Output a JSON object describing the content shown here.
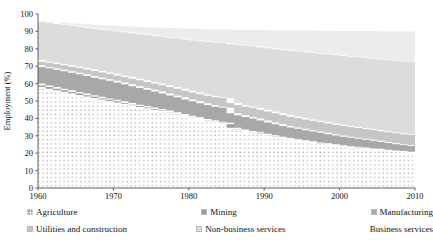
{
  "chart_data": {
    "type": "area",
    "title": "",
    "subtitle": "",
    "xlabel": "",
    "ylabel": "Employment (%)",
    "xlim": [
      1960,
      2010
    ],
    "ylim": [
      0,
      100
    ],
    "grid": false,
    "stacked": true,
    "legend_position": "bottom",
    "xticks": [
      1960,
      1970,
      1980,
      1990,
      2000,
      2010
    ],
    "yticks": [
      0,
      10,
      20,
      30,
      40,
      50,
      60,
      70,
      80,
      90,
      100
    ],
    "x": [
      1960,
      1961,
      1962,
      1963,
      1964,
      1965,
      1966,
      1967,
      1968,
      1969,
      1970,
      1971,
      1972,
      1973,
      1974,
      1975,
      1976,
      1977,
      1978,
      1979,
      1980,
      1981,
      1982,
      1983,
      1984,
      1985,
      1986,
      1987,
      1988,
      1989,
      1990,
      1991,
      1992,
      1993,
      1994,
      1995,
      1996,
      1997,
      1998,
      1999,
      2000,
      2001,
      2002,
      2003,
      2004,
      2005,
      2006,
      2007,
      2008,
      2009,
      2010
    ],
    "series": [
      {
        "name": "Agriculture",
        "color": "#ffffff",
        "pattern": "dots",
        "values": [
          58.0,
          57.0,
          56.2,
          55.3,
          54.4,
          53.5,
          52.6,
          51.7,
          50.8,
          50.0,
          49.2,
          48.4,
          47.5,
          46.6,
          45.8,
          45.0,
          44.2,
          43.4,
          42.4,
          41.5,
          40.5,
          39.6,
          38.8,
          38.0,
          37.2,
          36.6,
          33.8,
          32.8,
          32.0,
          31.4,
          30.5,
          29.6,
          28.8,
          28.0,
          27.4,
          26.8,
          26.2,
          25.6,
          25.1,
          24.6,
          24.1,
          23.6,
          23.2,
          22.8,
          22.4,
          22.0,
          21.6,
          21.2,
          20.8,
          20.4,
          20.0
        ]
      },
      {
        "name": "Mining",
        "color": "#9b9b9b",
        "values": [
          2.0,
          1.9,
          1.9,
          1.8,
          1.8,
          1.7,
          1.7,
          1.6,
          1.6,
          1.5,
          1.5,
          1.4,
          1.4,
          1.3,
          1.3,
          1.2,
          1.2,
          1.1,
          1.1,
          1.0,
          1.0,
          1.0,
          0.9,
          0.9,
          0.9,
          0.9,
          0.8,
          0.8,
          0.8,
          0.8,
          0.7,
          0.7,
          0.7,
          0.7,
          0.6,
          0.6,
          0.6,
          0.6,
          0.6,
          0.5,
          0.5,
          0.5,
          0.5,
          0.5,
          0.5,
          0.5,
          0.4,
          0.4,
          0.4,
          0.4,
          0.4
        ]
      },
      {
        "name": "Manufacturing",
        "color": "#a8a8a8",
        "values": [
          10.5,
          10.6,
          10.7,
          10.8,
          10.9,
          11.0,
          11.1,
          11.1,
          11.0,
          11.0,
          10.9,
          10.8,
          10.7,
          10.6,
          10.4,
          10.2,
          10.0,
          9.8,
          9.7,
          9.6,
          9.4,
          9.2,
          9.0,
          8.8,
          8.6,
          8.6,
          8.4,
          8.2,
          8.0,
          7.8,
          7.6,
          7.4,
          7.2,
          7.0,
          6.8,
          6.6,
          6.4,
          6.2,
          6.0,
          5.8,
          5.6,
          5.4,
          5.2,
          5.0,
          4.8,
          4.6,
          4.4,
          4.2,
          4.0,
          3.9,
          3.8
        ]
      },
      {
        "name": "Utilities and construction",
        "color": "#c6c6c6",
        "values": [
          3.0,
          3.1,
          3.2,
          3.3,
          3.4,
          3.5,
          3.6,
          3.7,
          3.8,
          3.9,
          4.0,
          4.1,
          4.2,
          4.3,
          4.4,
          4.5,
          4.6,
          4.7,
          4.8,
          4.9,
          5.0,
          5.1,
          5.2,
          5.3,
          5.4,
          5.6,
          5.8,
          5.9,
          6.0,
          6.1,
          6.2,
          6.2,
          6.2,
          6.2,
          6.2,
          6.2,
          6.2,
          6.2,
          6.2,
          6.2,
          6.2,
          6.2,
          6.2,
          6.2,
          6.2,
          6.2,
          6.2,
          6.2,
          6.2,
          6.2,
          6.2
        ]
      },
      {
        "name": "Non-business services",
        "color": "#dcdcdc",
        "values": [
          22.5,
          22.7,
          22.9,
          23.1,
          23.3,
          23.5,
          23.7,
          24.0,
          24.3,
          24.6,
          24.9,
          25.3,
          25.7,
          26.1,
          26.5,
          27.0,
          27.4,
          27.9,
          28.4,
          28.9,
          29.4,
          29.9,
          30.4,
          30.9,
          31.4,
          31.6,
          33.8,
          34.5,
          35.0,
          35.3,
          35.8,
          36.4,
          36.9,
          37.4,
          37.8,
          38.2,
          38.6,
          39.0,
          39.3,
          39.6,
          39.9,
          40.2,
          40.4,
          40.6,
          40.8,
          41.0,
          41.2,
          41.4,
          41.6,
          41.8,
          42.0
        ]
      },
      {
        "name": "Business services",
        "color": "#ececec",
        "values": [
          17.6,
          17.6,
          17.6,
          17.5,
          17.5,
          17.5,
          17.4,
          17.4,
          17.4,
          17.4,
          17.3,
          17.3,
          17.3,
          17.3,
          17.3,
          17.3,
          17.3,
          17.3,
          17.3,
          17.3,
          17.3,
          17.3,
          17.3,
          17.3,
          17.3,
          17.3,
          17.3,
          17.3,
          17.3,
          17.3,
          17.3,
          17.3,
          17.3,
          17.3,
          17.3,
          17.3,
          17.3,
          17.3,
          17.3,
          17.3,
          17.3,
          17.3,
          17.3,
          17.3,
          17.3,
          17.3,
          17.3,
          17.3,
          17.3,
          17.3,
          17.3
        ]
      }
    ],
    "stack_tops": {
      "agriculture": [
        58.0,
        57.0,
        56.2,
        55.3,
        54.4,
        53.5,
        52.6,
        51.7,
        50.8,
        50.0,
        49.2,
        48.4,
        47.5,
        46.6,
        45.8,
        45.0,
        44.2,
        43.4,
        42.4,
        41.5,
        40.5,
        39.6,
        38.8,
        38.0,
        37.2,
        36.6,
        33.8,
        32.8,
        32.0,
        31.4,
        30.5,
        29.6,
        28.8,
        28.0,
        27.4,
        26.8,
        26.2,
        25.6,
        25.1,
        24.6,
        24.1,
        23.6,
        23.2,
        22.8,
        22.4,
        22.0,
        21.6,
        21.2,
        20.8,
        20.4,
        20.0
      ],
      "mining": [
        60.0,
        58.9,
        58.1,
        57.1,
        56.2,
        55.2,
        54.3,
        53.3,
        52.4,
        51.5,
        50.7,
        49.8,
        48.9,
        47.9,
        47.1,
        46.2,
        45.4,
        44.5,
        43.5,
        42.5,
        41.5,
        40.6,
        39.7,
        38.9,
        38.1,
        37.5,
        34.6,
        33.6,
        32.8,
        32.2,
        31.2,
        30.3,
        29.5,
        28.7,
        28.0,
        27.4,
        26.8,
        26.2,
        25.7,
        25.1,
        24.6,
        24.1,
        23.7,
        23.3,
        22.9,
        22.5,
        22.0,
        21.6,
        21.2,
        20.8,
        20.4
      ],
      "manufacturing": [
        70.5,
        69.5,
        68.8,
        67.9,
        67.1,
        66.2,
        65.4,
        64.4,
        63.4,
        62.5,
        61.6,
        60.6,
        59.6,
        58.5,
        57.5,
        56.4,
        55.4,
        54.3,
        53.2,
        52.1,
        50.9,
        49.8,
        48.7,
        47.7,
        46.7,
        46.1,
        43.0,
        41.8,
        40.8,
        40.0,
        38.8,
        37.7,
        36.7,
        35.7,
        34.8,
        34.0,
        33.2,
        32.4,
        31.7,
        30.9,
        30.2,
        29.5,
        28.9,
        28.3,
        27.7,
        27.1,
        26.4,
        25.8,
        25.2,
        24.7,
        24.2
      ],
      "utilities_construction": [
        73.5,
        72.6,
        72.0,
        71.2,
        70.5,
        69.7,
        69.0,
        68.1,
        67.2,
        66.4,
        65.6,
        64.7,
        63.8,
        62.8,
        61.9,
        60.9,
        60.0,
        59.0,
        58.0,
        57.0,
        55.9,
        54.9,
        53.9,
        53.0,
        52.1,
        51.7,
        48.8,
        47.7,
        46.8,
        46.1,
        45.0,
        43.9,
        42.9,
        41.9,
        41.0,
        40.2,
        39.4,
        38.6,
        37.9,
        37.1,
        36.4,
        35.7,
        35.1,
        34.5,
        33.9,
        33.3,
        32.6,
        32.0,
        31.4,
        30.9,
        30.4
      ],
      "non_business_services": [
        96.0,
        95.3,
        94.9,
        94.3,
        93.8,
        93.2,
        92.7,
        92.1,
        91.5,
        91.0,
        90.5,
        90.0,
        89.5,
        88.9,
        88.4,
        87.9,
        87.4,
        86.9,
        86.4,
        85.9,
        85.3,
        84.8,
        84.3,
        83.9,
        83.5,
        83.3,
        82.6,
        82.2,
        81.8,
        81.4,
        80.8,
        80.3,
        79.8,
        79.3,
        78.8,
        78.4,
        78.0,
        77.6,
        77.2,
        76.7,
        76.3,
        75.9,
        75.5,
        75.1,
        74.7,
        74.3,
        73.8,
        73.4,
        73.0,
        72.7,
        72.4
      ],
      "business_services": [
        96.0,
        95.6,
        95.4,
        95.1,
        94.9,
        94.6,
        94.4,
        94.1,
        93.8,
        93.6,
        93.4,
        93.2,
        93.0,
        92.8,
        92.6,
        92.4,
        92.3,
        92.1,
        91.9,
        91.8,
        91.6,
        91.5,
        91.4,
        91.3,
        91.2,
        91.2,
        91.1,
        91.0,
        91.0,
        90.9,
        90.8,
        90.8,
        90.7,
        90.7,
        90.6,
        90.6,
        90.5,
        90.5,
        90.4,
        90.4,
        90.3,
        90.3,
        90.3,
        90.2,
        90.2,
        90.2,
        90.1,
        90.1,
        90.1,
        90.0,
        90.0
      ]
    }
  },
  "axis": {
    "y_title": "Employment (%)",
    "y_ticks": [
      "100",
      "90",
      "80",
      "70",
      "60",
      "50",
      "40",
      "30",
      "20",
      "10",
      "0"
    ],
    "x_ticks": [
      "1960",
      "1970",
      "1980",
      "1990",
      "2000",
      "2010"
    ]
  },
  "legend": {
    "items": [
      {
        "label": "Agriculture",
        "swatch": "dots",
        "color": "#ffffff"
      },
      {
        "label": "Mining",
        "swatch": "solid",
        "color": "#9b9b9b"
      },
      {
        "label": "Manufacturing",
        "swatch": "solid",
        "color": "#a8a8a8"
      },
      {
        "label": "Utilities and construction",
        "swatch": "solid",
        "color": "#c6c6c6"
      },
      {
        "label": "Non-business services",
        "swatch": "solid",
        "color": "#dcdcdc"
      },
      {
        "label": "Business services",
        "swatch": "none",
        "color": "#ececec"
      }
    ]
  }
}
